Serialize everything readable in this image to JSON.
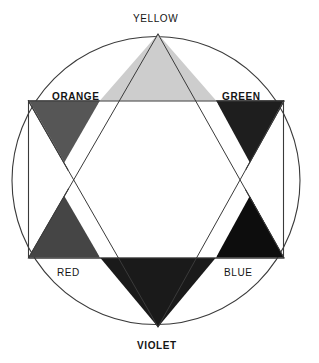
{
  "diagram": {
    "background_color": "#ffffff",
    "line_color": "#3a3a3a",
    "label_color": "#141414",
    "geometry": {
      "center_x": 156,
      "center_y": 180,
      "circle_radius": 145,
      "circle_left_x": 12,
      "circle_right_x": 300,
      "circle_top_y": 33,
      "circle_bottom_y": 328,
      "chord_left_x": 28,
      "chord_right_x": 283,
      "upright_triangle_points": "158,33 28,258 285,258",
      "inverted_triangle_points": "158,328 28,100 285,100"
    },
    "labels": {
      "yellow": "YELLOW",
      "orange": "ORANGE",
      "green": "GREEN",
      "red": "RED",
      "blue": "BLUE",
      "violet": "VIOLET"
    },
    "label_weights": {
      "yellow": "regular",
      "orange": "bold",
      "green": "bold",
      "red": "regular",
      "blue": "regular",
      "violet": "bold"
    },
    "points": [
      {
        "name": "yellow",
        "label": "YELLOW",
        "position": "top",
        "fill": "#cdcdcd",
        "triangle_points": "158,34 100,100 216,100"
      },
      {
        "name": "orange",
        "label": "ORANGE",
        "position": "upper-left",
        "fill": "#565656",
        "triangle_points": "29,101 100,101 64,163"
      },
      {
        "name": "green",
        "label": "GREEN",
        "position": "upper-right",
        "fill": "#1e1e1e",
        "triangle_points": "216,101 284,101 250,163"
      },
      {
        "name": "red",
        "label": "RED",
        "position": "lower-left",
        "fill": "#454545",
        "triangle_points": "29,257 64,196 100,257"
      },
      {
        "name": "blue",
        "label": "BLUE",
        "position": "lower-right",
        "fill": "#0d0d0d",
        "triangle_points": "216,257 250,196 284,257"
      },
      {
        "name": "violet",
        "label": "VIOLET",
        "position": "bottom",
        "fill": "#1a1a1a",
        "triangle_points": "100,258 216,258 158,327"
      }
    ],
    "hexagon": {
      "fill": "#ffffff",
      "points": "100,100 216,100 250,179 216,258 100,258 64,179"
    }
  }
}
